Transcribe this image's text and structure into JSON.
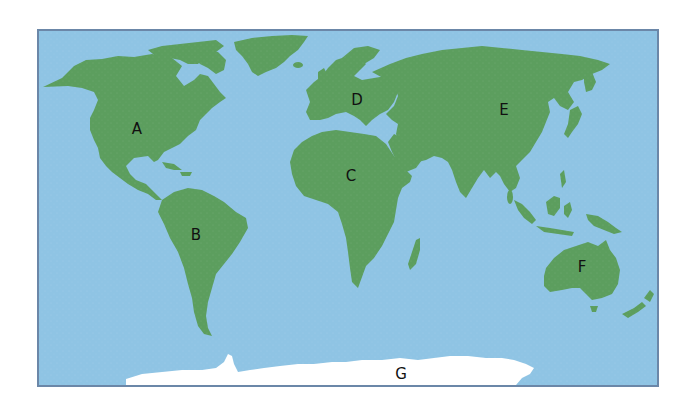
{
  "map": {
    "type": "world-map",
    "projection": "equirectangular-style",
    "colors": {
      "ocean": "#8fc4e4",
      "land": "#5c9e5e",
      "ice": "#ffffff",
      "border": "#6b87a8",
      "label": "#111111"
    },
    "labels": [
      {
        "id": "A",
        "text": "A",
        "region": "North America",
        "x": 137,
        "y": 129
      },
      {
        "id": "B",
        "text": "B",
        "region": "South America",
        "x": 196,
        "y": 235
      },
      {
        "id": "C",
        "text": "C",
        "region": "Africa",
        "x": 351,
        "y": 176
      },
      {
        "id": "D",
        "text": "D",
        "region": "Europe",
        "x": 357,
        "y": 100
      },
      {
        "id": "E",
        "text": "E",
        "region": "Asia",
        "x": 504,
        "y": 110
      },
      {
        "id": "F",
        "text": "F",
        "region": "Australia",
        "x": 582,
        "y": 267
      },
      {
        "id": "G",
        "text": "G",
        "region": "Antarctica",
        "x": 401,
        "y": 374
      }
    ]
  }
}
